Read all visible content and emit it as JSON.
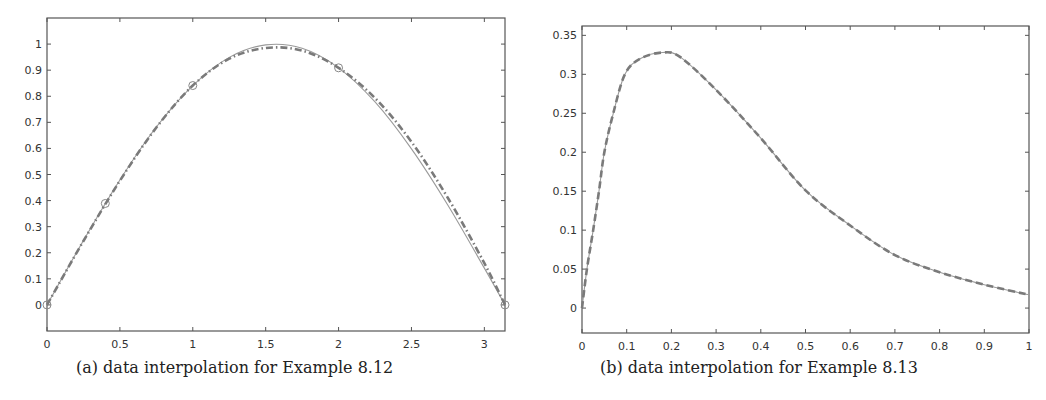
{
  "figures": [
    {
      "caption": "(a) data interpolation for Example 8.12"
    },
    {
      "caption": "(b) data interpolation for Example 8.13"
    }
  ],
  "colors": {
    "axis": "#555555",
    "thin_line": "#9a9a9a",
    "dashed_line": "#7a7a7a",
    "marker": "#888888"
  },
  "chart_data": [
    {
      "type": "line",
      "title": "(a) data interpolation for Example 8.12",
      "xlabel": "",
      "ylabel": "",
      "xlim": [
        0,
        3.1416
      ],
      "ylim": [
        -0.1,
        1.1
      ],
      "xticks": [
        "0",
        "0.5",
        "1",
        "1.5",
        "2",
        "2.5",
        "3"
      ],
      "yticks": [
        "0",
        "0.1",
        "0.2",
        "0.3",
        "0.4",
        "0.5",
        "0.6",
        "0.7",
        "0.8",
        "0.9",
        "1"
      ],
      "grid": false,
      "legend": null,
      "series": [
        {
          "name": "data points",
          "style": "circle-markers",
          "x": [
            0,
            0.4,
            1.0,
            2.0,
            3.1416
          ],
          "y": [
            0,
            0.389,
            0.841,
            0.909,
            0
          ]
        },
        {
          "name": "thin solid curve",
          "style": "solid-thin",
          "x": [
            0,
            0.25,
            0.5,
            0.75,
            1.0,
            1.25,
            1.5,
            1.75,
            2.0,
            2.25,
            2.5,
            2.75,
            3.0,
            3.1416
          ],
          "y": [
            0,
            0.247,
            0.479,
            0.682,
            0.841,
            0.949,
            0.997,
            0.984,
            0.909,
            0.778,
            0.598,
            0.382,
            0.141,
            0
          ]
        },
        {
          "name": "dashed interpolant",
          "style": "dash-dot-thick",
          "x": [
            0,
            0.25,
            0.5,
            0.75,
            1.0,
            1.25,
            1.5,
            1.75,
            2.0,
            2.25,
            2.5,
            2.75,
            3.0,
            3.1416
          ],
          "y": [
            0,
            0.245,
            0.476,
            0.68,
            0.841,
            0.944,
            0.985,
            0.975,
            0.909,
            0.793,
            0.625,
            0.41,
            0.16,
            0
          ]
        }
      ]
    },
    {
      "type": "line",
      "title": "(b) data interpolation for Example 8.13",
      "xlabel": "",
      "ylabel": "",
      "xlim": [
        0,
        1
      ],
      "ylim": [
        -0.032,
        0.362
      ],
      "xticks": [
        "0",
        "0.1",
        "0.2",
        "0.3",
        "0.4",
        "0.5",
        "0.6",
        "0.7",
        "0.8",
        "0.9",
        "1"
      ],
      "yticks": [
        "0",
        "0.05",
        "0.1",
        "0.15",
        "0.2",
        "0.25",
        "0.3",
        "0.35"
      ],
      "grid": false,
      "legend": null,
      "series": [
        {
          "name": "thin solid curve",
          "style": "solid-thin",
          "x": [
            0,
            0.011,
            0.025,
            0.038,
            0.05,
            0.07,
            0.096,
            0.13,
            0.18,
            0.22,
            0.3,
            0.4,
            0.5,
            0.6,
            0.7,
            0.8,
            0.9,
            1.0
          ],
          "y": [
            0,
            0.05,
            0.1,
            0.15,
            0.2,
            0.25,
            0.3,
            0.32,
            0.328,
            0.322,
            0.28,
            0.218,
            0.151,
            0.106,
            0.068,
            0.046,
            0.03,
            0.017
          ]
        },
        {
          "name": "dashed interpolant",
          "style": "dash-thick",
          "x": [
            0,
            0.011,
            0.025,
            0.038,
            0.05,
            0.07,
            0.096,
            0.13,
            0.18,
            0.22,
            0.3,
            0.4,
            0.5,
            0.6,
            0.7,
            0.8,
            0.9,
            1.0
          ],
          "y": [
            0,
            0.05,
            0.1,
            0.15,
            0.2,
            0.25,
            0.3,
            0.32,
            0.328,
            0.322,
            0.28,
            0.218,
            0.151,
            0.106,
            0.068,
            0.046,
            0.03,
            0.017
          ]
        }
      ]
    }
  ]
}
